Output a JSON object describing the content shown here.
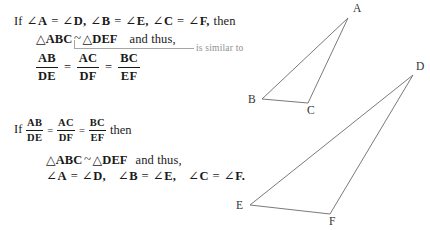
{
  "page": {
    "background": "#ffffff",
    "text_color": "#1a1a1a",
    "stroke_color": "#7a7a7a",
    "callout_color": "#a6a6a6",
    "callout_text_color": "#8f8f8f"
  },
  "block1": {
    "line1": {
      "if": "If",
      "angle_symbol": "∠",
      "a": "A",
      "eq1": "=",
      "d": "D,",
      "b": "B",
      "eq2": "=",
      "e": "E,",
      "c": "C",
      "eq3": "=",
      "f": "F,",
      "then": "then"
    },
    "line2": {
      "triangle_symbol": "△",
      "abc": "ABC",
      "similar_symbol": "~",
      "triangle_symbol2": "△",
      "def": "DEF",
      "and_thus": "and thus,"
    },
    "proportion": {
      "f1_num": "AB",
      "f1_den": "DE",
      "eq1": "=",
      "f2_num": "AC",
      "f2_den": "DF",
      "eq2": "=",
      "f3_num": "BC",
      "f3_den": "EF"
    }
  },
  "callout": {
    "label": "is similar to"
  },
  "block2": {
    "line1": {
      "if": "If",
      "f1_num": "AB",
      "f1_den": "DE",
      "eq1": "=",
      "f2_num": "AC",
      "f2_den": "DF",
      "eq2": "=",
      "f3_num": "BC",
      "f3_den": "EF",
      "then": "then"
    },
    "line2": {
      "triangle_symbol": "△",
      "abc": "ABC",
      "similar_symbol": "~",
      "triangle_symbol2": "△",
      "def": "DEF",
      "and_thus": "and thus,"
    },
    "line3": {
      "angle_symbol": "∠",
      "a": "A",
      "eq1": "=",
      "d": "D,",
      "b": "B",
      "eq2": "=",
      "e": "E,",
      "c": "C",
      "eq3": "=",
      "f": "F."
    }
  },
  "figures": {
    "triangle_abc": {
      "name": "triangle-abc",
      "points": "348,18 262,99 308,103",
      "vertices": [
        {
          "label": "A",
          "x": 353,
          "y": 12
        },
        {
          "label": "B",
          "x": 248,
          "y": 103
        },
        {
          "label": "C",
          "x": 307,
          "y": 114
        }
      ]
    },
    "triangle_def": {
      "name": "triangle-def",
      "points": "413,75 250,205 330,214",
      "vertices": [
        {
          "label": "D",
          "x": 416,
          "y": 70
        },
        {
          "label": "E",
          "x": 236,
          "y": 209
        },
        {
          "label": "F",
          "x": 329,
          "y": 225
        }
      ]
    }
  }
}
